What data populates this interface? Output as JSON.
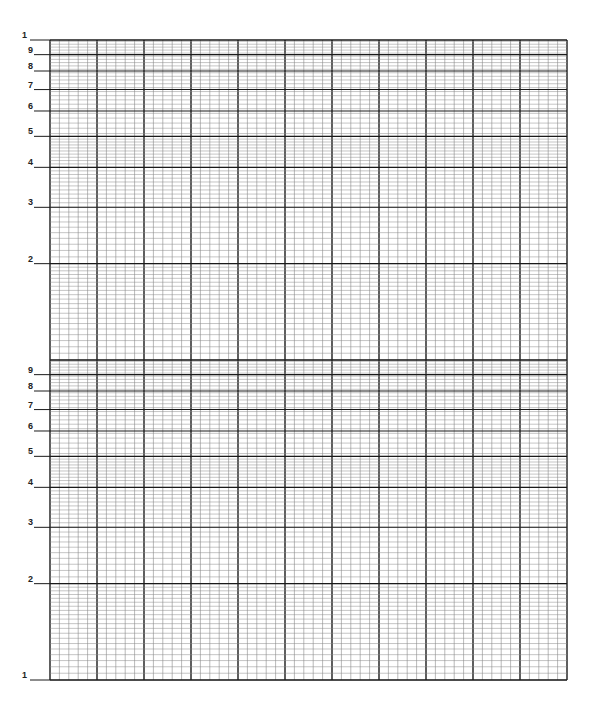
{
  "paper": {
    "type": "semi-log graph paper",
    "cycles": 2,
    "major_columns": 11,
    "minor_per_column": 5,
    "y_labels": [
      "1",
      "9",
      "8",
      "7",
      "6",
      "5",
      "4",
      "3",
      "2",
      "1"
    ],
    "colors": {
      "major": "#1a1a1a",
      "minor": "#8a8a8a",
      "background": "#ffffff"
    }
  }
}
